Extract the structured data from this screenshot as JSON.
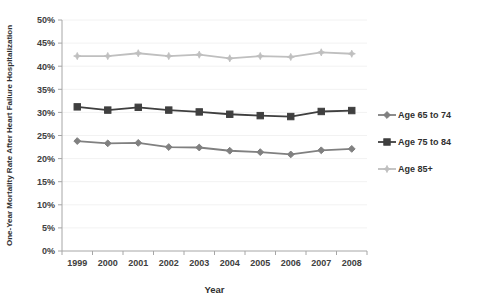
{
  "chart_data": {
    "type": "line",
    "title": "",
    "xlabel": "Year",
    "ylabel": "One-Year Mortality Rate After Heart Failure Hospitalization",
    "categories": [
      "1999",
      "2000",
      "2001",
      "2002",
      "2003",
      "2004",
      "2005",
      "2006",
      "2007",
      "2008"
    ],
    "ylim": [
      0,
      50
    ],
    "ytick_values": [
      0,
      5,
      10,
      15,
      20,
      25,
      30,
      35,
      40,
      45,
      50
    ],
    "ytick_labels": [
      "0%",
      "5%",
      "10%",
      "15%",
      "20%",
      "25%",
      "30%",
      "35%",
      "40%",
      "45%",
      "50%"
    ],
    "grid": true,
    "legend_position": "right",
    "series": [
      {
        "name": "Age 65 to 74",
        "color": "#808080",
        "marker": "diamond",
        "values": [
          23.8,
          23.3,
          23.4,
          22.5,
          22.4,
          21.7,
          21.4,
          20.9,
          21.8,
          22.1
        ]
      },
      {
        "name": "Age 75 to 84",
        "color": "#3f3f3f",
        "marker": "square",
        "values": [
          31.2,
          30.5,
          31.1,
          30.5,
          30.1,
          29.6,
          29.3,
          29.1,
          30.2,
          30.4
        ]
      },
      {
        "name": "Age 85+",
        "color": "#bfbfbf",
        "marker": "star",
        "values": [
          42.2,
          42.2,
          42.8,
          42.2,
          42.5,
          41.7,
          42.2,
          42.0,
          43.0,
          42.7
        ]
      }
    ]
  },
  "legend": {
    "items": [
      {
        "label": "Age 65 to 74"
      },
      {
        "label": "Age 75 to 84"
      },
      {
        "label": "Age 85+"
      }
    ]
  },
  "axes": {
    "x_title": "Year",
    "y_title": "One-Year Mortality Rate After Heart Failure Hospitalization"
  }
}
